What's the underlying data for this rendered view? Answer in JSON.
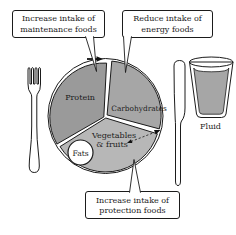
{
  "figure": {
    "callouts": {
      "maintenance": {
        "line1": "Increase intake of",
        "line2": "maintenance foods"
      },
      "energy": {
        "line1": "Reduce intake of",
        "line2": "energy foods"
      },
      "protection": {
        "line1": "Increase intake of",
        "line2": "protection foods"
      }
    },
    "plate": {
      "protein": {
        "label": "Protein",
        "color": "#9a9a9a"
      },
      "carbohydrates": {
        "label": "Carbohydrates",
        "color": "#a6a6a6"
      },
      "vegetables": {
        "line1": "Vegetables",
        "line2": "& fruits",
        "color": "#b7b7b7"
      },
      "fats": {
        "label": "Fats",
        "color": "#ffffff"
      }
    },
    "fluid": {
      "label": "Fluid",
      "color": "#a6a6a6"
    },
    "icons": {
      "fork": "fork-icon",
      "knife": "knife-icon",
      "glass": "glass-icon",
      "shift_arrow": "arrow-right-icon",
      "exchange_arrow": "dashed-double-arrow-icon"
    },
    "colors": {
      "outline": "#1b1b1b",
      "background": "#ffffff"
    }
  }
}
